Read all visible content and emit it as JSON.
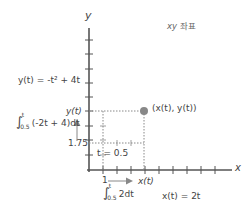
{
  "title": "xy 좌표",
  "axes": {
    "x_label": "x",
    "y_label": "y"
  },
  "equations": {
    "y_of_t": "y(t) = -t² + 4t",
    "x_of_t": "x(t) = 2t"
  },
  "integrals": {
    "y_integral": {
      "lower": "0.5",
      "upper": "t",
      "integrand": "(-2t + 4)dt"
    },
    "x_integral": {
      "lower": "0.5",
      "upper": "t",
      "integrand": "2dt"
    }
  },
  "annotations": {
    "point_label": "(x(t), y(t))",
    "t_label": "t = 0.5",
    "y_start": "1.75",
    "x_start": "1",
    "y_tick_label": "y(t)",
    "x_tick_label": "x(t)"
  },
  "colors": {
    "axis": "#555555",
    "point": "#888888",
    "dotted": "#888888",
    "text": "#444444"
  }
}
